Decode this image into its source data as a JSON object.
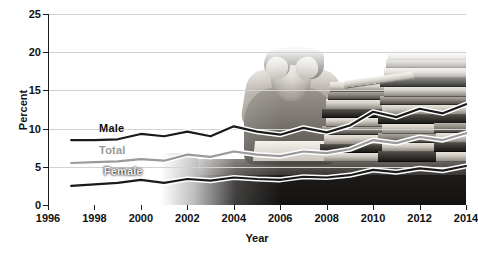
{
  "chart_data": {
    "type": "line",
    "title": "",
    "xlabel": "Year",
    "ylabel": "Percent",
    "xlim": [
      1996,
      2014
    ],
    "ylim": [
      0,
      25
    ],
    "xticks": [
      1996,
      1998,
      2000,
      2002,
      2004,
      2006,
      2008,
      2010,
      2012,
      2014
    ],
    "yticks": [
      0,
      5,
      10,
      15,
      20,
      25
    ],
    "grid": true,
    "legend_position": "inline-left",
    "x": [
      1997,
      1998,
      1999,
      2000,
      2001,
      2002,
      2003,
      2004,
      2005,
      2006,
      2007,
      2008,
      2009,
      2010,
      2011,
      2012,
      2013,
      2014
    ],
    "series": [
      {
        "name": "Male",
        "color": "#1a1a1a",
        "values": [
          8.5,
          8.5,
          8.6,
          9.3,
          9.0,
          9.6,
          9.0,
          10.3,
          9.6,
          9.2,
          10.1,
          9.5,
          10.4,
          12.2,
          11.5,
          12.6,
          12.0,
          13.2
        ]
      },
      {
        "name": "Total",
        "color": "#9a9a9a",
        "values": [
          5.5,
          5.6,
          5.7,
          6.0,
          5.8,
          6.6,
          6.3,
          7.0,
          6.6,
          6.4,
          7.0,
          6.8,
          7.3,
          8.5,
          8.1,
          8.9,
          8.5,
          9.4
        ]
      },
      {
        "name": "Female",
        "color": "#1a1a1a",
        "values": [
          2.5,
          2.7,
          2.9,
          3.3,
          2.9,
          3.4,
          3.2,
          3.6,
          3.4,
          3.3,
          3.7,
          3.6,
          3.9,
          4.6,
          4.3,
          4.8,
          4.5,
          5.1
        ]
      }
    ],
    "series_labels": [
      {
        "text": "Male",
        "x": 1998.2,
        "y": 10.1
      },
      {
        "text": "Total",
        "x": 1998.2,
        "y": 7.2
      },
      {
        "text": "Female",
        "x": 1998.4,
        "y": 4.4
      }
    ]
  },
  "background_photo": {
    "description": "stressed-person-with-book-stacks",
    "style": "grayscale"
  }
}
